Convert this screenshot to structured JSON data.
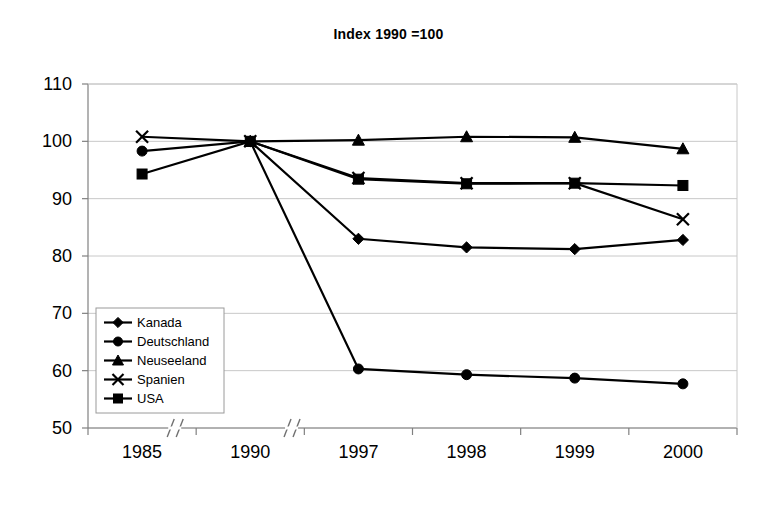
{
  "chart_data": {
    "type": "line",
    "title": "Index 1990 =100",
    "xlabel": "",
    "ylabel": "",
    "categories": [
      "1985",
      "1990",
      "1997",
      "1998",
      "1999",
      "2000"
    ],
    "ylim": [
      50,
      110
    ],
    "yticks": [
      50,
      60,
      70,
      80,
      90,
      100,
      110
    ],
    "grid": true,
    "legend_position": "inside-bottom-left",
    "axis_breaks": [
      "between 1985 and 1990",
      "between 1990 and 1997"
    ],
    "series": [
      {
        "name": "Kanada",
        "marker": "diamond",
        "values": [
          null,
          100.0,
          83.0,
          81.5,
          81.2,
          82.8
        ]
      },
      {
        "name": "Deutschland",
        "marker": "circle",
        "values": [
          98.3,
          100.0,
          60.3,
          59.3,
          58.7,
          57.7
        ]
      },
      {
        "name": "Neuseeland",
        "marker": "triangle",
        "values": [
          null,
          100.0,
          100.2,
          100.8,
          100.7,
          98.7
        ]
      },
      {
        "name": "Spanien",
        "marker": "cross",
        "values": [
          100.8,
          100.0,
          93.6,
          92.7,
          92.7,
          86.4
        ]
      },
      {
        "name": "USA",
        "marker": "square",
        "values": [
          94.3,
          100.0,
          93.4,
          92.6,
          92.7,
          92.3
        ]
      }
    ]
  }
}
